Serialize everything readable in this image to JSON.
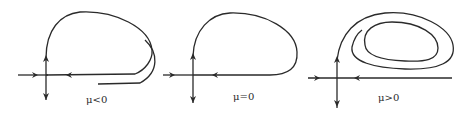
{
  "figure": {
    "type": "phase-portraits",
    "stroke_color": "#2a2a2a",
    "background": "#ffffff"
  },
  "panels": [
    {
      "id": "mu-negative",
      "label": "μ<0",
      "case": "stable and unstable manifolds miss each other"
    },
    {
      "id": "mu-zero",
      "label": "μ=0",
      "case": "homoclinic orbit"
    },
    {
      "id": "mu-positive",
      "label": "μ>0",
      "case": "limit cycle born inside loop"
    }
  ]
}
